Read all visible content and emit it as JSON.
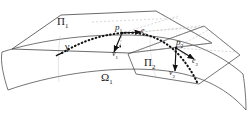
{
  "figure": {
    "type": "geometry-diagram",
    "background_color": "#ffffff",
    "line_color": "#333333",
    "dashed_color": "#9a9a9a",
    "curve_color": "#111111"
  },
  "labels": {
    "plane1": {
      "text": "Π",
      "sub": "1",
      "x": 58,
      "y": 22
    },
    "plane2": {
      "text": "Π",
      "sub": "2",
      "x": 146,
      "y": 62
    },
    "surface": {
      "text": "Ω",
      "sub": "1",
      "x": 105,
      "y": 77
    },
    "curve": {
      "text": "γ",
      "sub": "",
      "x": 68,
      "y": 47
    },
    "point1": {
      "text": "p",
      "sub": "1",
      "x": 117,
      "y": 28
    },
    "point2": {
      "text": "p",
      "sub": "2",
      "x": 178,
      "y": 46
    },
    "vector_v1": {
      "text": "v",
      "sub": "1",
      "x": 119,
      "y": 54
    },
    "vector_e1": {
      "text": "e",
      "sub": "1",
      "x": 143,
      "y": 33
    },
    "vector_v2": {
      "text": "v",
      "sub": "2",
      "x": 170,
      "y": 70
    },
    "vector_e2": {
      "text": "e",
      "sub": "2",
      "x": 193,
      "y": 62
    }
  },
  "geometry": {
    "plane1_outline": "12,48 62,15 155,12 210,42 128,52",
    "plane2_outline": "128,52 200,24 238,52 200,80 138,72",
    "surface_top_edge": "2,52 40,42 95,35 150,38 205,52 243,72",
    "surface_bottom_edge": "8,88 50,74 104,66 158,70 212,88 246,108",
    "geodesic_points": "68,50 82,44 96,39 110,34 122,31 136,32 150,36 162,42 172,49 180,56 188,64 195,73",
    "tangent_v1": {
      "x1": 122,
      "y1": 33,
      "x2": 114,
      "y2": 53
    },
    "tangent_e1": {
      "x1": 122,
      "y1": 33,
      "x2": 142,
      "y2": 32
    },
    "tangent_v2": {
      "x1": 176,
      "y1": 48,
      "x2": 175,
      "y2": 72
    },
    "tangent_e2": {
      "x1": 176,
      "y1": 48,
      "x2": 195,
      "y2": 59
    }
  }
}
